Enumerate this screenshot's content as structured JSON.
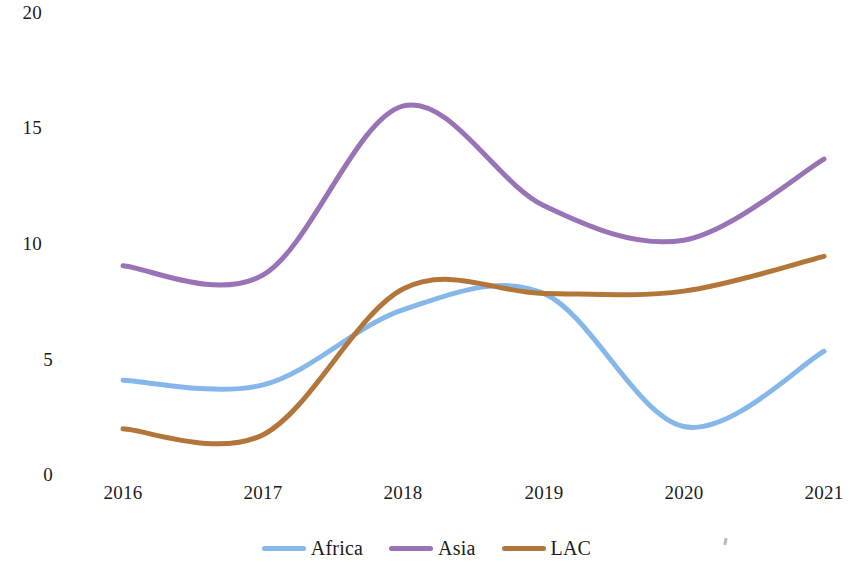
{
  "chart_data": {
    "type": "line",
    "title": "",
    "subtitle": "",
    "xlabel": "",
    "ylabel": "",
    "x": [
      2016,
      2017,
      2018,
      2019,
      2020,
      2021
    ],
    "xtick_labels": [
      "2016",
      "2017",
      "2018",
      "2019",
      "2020",
      "2021"
    ],
    "ytick_labels": [
      "20",
      "15",
      "10",
      "5",
      "0"
    ],
    "ytick_values": [
      20,
      15,
      10,
      5,
      0
    ],
    "xlim": [
      2016,
      2021
    ],
    "ylim": [
      0,
      20
    ],
    "grid": false,
    "smoothed": true,
    "legend_position": "bottom-center",
    "series": [
      {
        "name": "Africa",
        "color": "#85b7ea",
        "values": [
          4.05,
          3.85,
          7.1,
          7.8,
          2.05,
          5.3
        ],
        "peak_note": "local max 8.6 near 2018.5",
        "min_note": "local min 2.0 near 2020.1"
      },
      {
        "name": "Asia",
        "color": "#9a72b6",
        "values": [
          9.0,
          8.6,
          15.9,
          11.6,
          10.1,
          13.6
        ],
        "peak_note": "peak 15.9 at 2018",
        "min_note": "local min 10.1 near 2019.8"
      },
      {
        "name": "LAC",
        "color": "#b3763a",
        "values": [
          1.95,
          1.7,
          8.0,
          7.8,
          7.9,
          9.4
        ],
        "peak_note": "local max 8.1 near 2018.2",
        "min_note": "local min 1.65 near 2016.7"
      }
    ]
  },
  "legend": {
    "items": [
      {
        "label": "Africa",
        "color": "#85b7ea"
      },
      {
        "label": "Asia",
        "color": "#9a72b6"
      },
      {
        "label": "LAC",
        "color": "#b3763a"
      }
    ]
  },
  "axes": {
    "y_labels": [
      "20",
      "15",
      "10",
      "5",
      "0"
    ],
    "x_labels": [
      "2016",
      "2017",
      "2018",
      "2019",
      "2020",
      "2021"
    ]
  }
}
